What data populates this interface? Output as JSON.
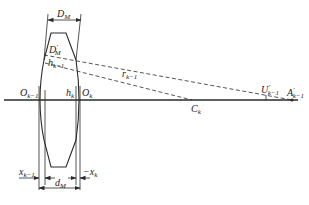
{
  "diagram": {
    "type": "lens-ray-geometry",
    "labels": {
      "D_M": "D",
      "D_M_sub": "M",
      "D_prime_M": "D",
      "D_prime_M_sup": "′",
      "D_prime_M_sub": "M",
      "h_k_minus_1": "h",
      "h_k_minus_1_sub": "k−1",
      "h_k": "h",
      "h_k_sub": "k",
      "O_k_minus_1": "O",
      "O_k_minus_1_sub": "k−1",
      "O_k": "O",
      "O_k_sub": "k",
      "r_k_minus_1": "r",
      "r_k_minus_1_sub": "k−1",
      "C_k": "C",
      "C_k_sub": "k",
      "U_prime_k_minus_1": "U",
      "U_prime_sup": "′",
      "U_prime_sub": "k−1",
      "A_prime_k_minus_1": "A",
      "A_prime_sup": "′",
      "A_prime_sub": "k−1",
      "x_k_minus_1": "x",
      "x_k_minus_1_sub": "k−1",
      "d_M": "d",
      "d_M_sub": "M",
      "neg_x_k": "−x",
      "neg_x_k_sub": "k"
    },
    "colors": {
      "stroke": "#2a2a2a",
      "text": "#222222",
      "background": "#ffffff"
    }
  }
}
